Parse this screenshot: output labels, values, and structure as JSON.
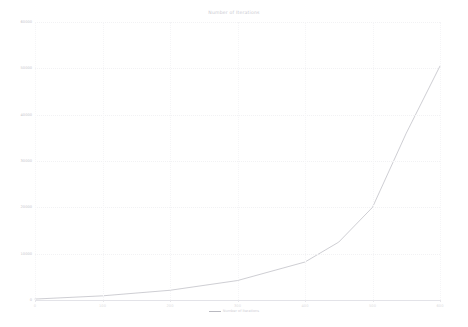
{
  "chart_data": {
    "type": "line",
    "title": "Number of Iterations",
    "xlabel": "",
    "ylabel": "",
    "grid": true,
    "legend_position": "bottom-center",
    "xlim": [
      0,
      600
    ],
    "ylim": [
      0,
      60000
    ],
    "x_ticks": [
      0,
      100,
      200,
      300,
      400,
      500,
      600
    ],
    "x_tick_labels": [
      "0",
      "100",
      "200",
      "300",
      "400",
      "500",
      "600"
    ],
    "y_ticks": [
      0,
      10000,
      20000,
      30000,
      40000,
      50000,
      60000
    ],
    "y_tick_labels": [
      "0",
      "10000",
      "20000",
      "30000",
      "40000",
      "50000",
      "60000"
    ],
    "series": [
      {
        "name": "Number of Iterations",
        "color": "#b9b9c0",
        "x": [
          0,
          100,
          200,
          300,
          400,
          450,
          500,
          550,
          600
        ],
        "values": [
          200,
          900,
          2100,
          4200,
          8200,
          12500,
          20000,
          36000,
          50500
        ]
      }
    ]
  },
  "legend": {
    "marker_name": "line-swatch",
    "label": "Number of Iterations"
  }
}
